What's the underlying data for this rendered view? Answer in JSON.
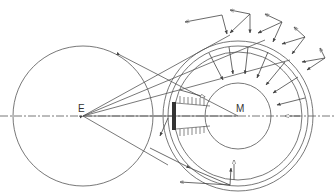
{
  "diagram": {
    "labels": {
      "left_center": "E",
      "right_center": "M"
    },
    "colors": {
      "stroke": "#555555",
      "background": "#ffffff",
      "fill_dark": "#333333"
    },
    "elements": {
      "left_circle": {
        "cx": 83,
        "cy": 116,
        "r": 70
      },
      "right_outer_ring": {
        "cx": 238,
        "cy": 116,
        "r": 75
      },
      "right_ring_2": {
        "cx": 238,
        "cy": 116,
        "r": 70
      },
      "right_ring_3": {
        "cx": 238,
        "cy": 116,
        "r": 64
      },
      "inner_circle": {
        "cx": 238,
        "cy": 116,
        "r": 33
      },
      "axis": {
        "y": 116,
        "style": "dash-dot"
      }
    }
  }
}
